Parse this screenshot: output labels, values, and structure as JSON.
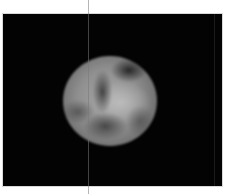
{
  "image": {
    "subject": "planet",
    "description": "Grayscale telescopic image of a planet disk on black background",
    "colors": {
      "page_background": "#ffffff",
      "frame_background": "#030303",
      "planet_mid": "#8f8f8f",
      "planet_light": "#c8c8c8",
      "planet_dark": "#2a2a2a",
      "line": "#787878"
    }
  }
}
